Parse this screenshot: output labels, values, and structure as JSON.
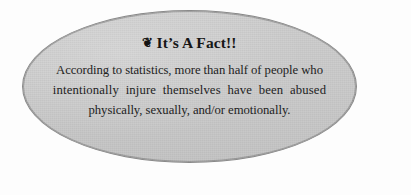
{
  "canvas": {
    "width": 411,
    "height": 195,
    "background_color": "#fdfdfd"
  },
  "callout": {
    "shape": "ellipse",
    "fill_color": "#c9c9c9",
    "border_color": "#8a8a8a",
    "title": {
      "bullet_icon": "clover-bullet-icon",
      "bullet_glyph": "❦",
      "text": "It’s A Fact!!",
      "color": "#171717"
    },
    "body": {
      "color": "#222222",
      "full_text": "According to statistics, more than half of people who intentionally injure themselves have been abused physically, sexually, and/or emotionally.",
      "lines": [
        "According to statistics, more than half of people who",
        "intentionally injure themselves have been abused",
        "physically, sexually, and/or emotionally."
      ]
    }
  }
}
